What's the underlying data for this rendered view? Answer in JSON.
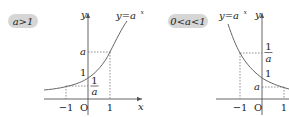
{
  "diagram": {
    "left": {
      "condition_label": "a>1",
      "function_label": "y=a^x",
      "function_label_base": "y=a",
      "function_label_exp": "x",
      "axis_x_label": "x",
      "axis_y_label": "y",
      "origin_label": "O",
      "x_ticks": [
        "−1",
        "1"
      ],
      "y_ticks": {
        "a": "a",
        "one": "1",
        "inv_num": "1",
        "inv_den": "a"
      },
      "behavior": "increasing"
    },
    "right": {
      "condition_label": "0<a<1",
      "function_label": "y=a^x",
      "function_label_base": "y=a",
      "function_label_exp": "x",
      "axis_y_label": "y",
      "origin_label": "O",
      "x_ticks": [
        "−1",
        "1"
      ],
      "y_ticks": {
        "a": "a",
        "one": "1",
        "inv_num": "1",
        "inv_den": "a"
      },
      "behavior": "decreasing"
    },
    "colors": {
      "badge": "#d6d6d6",
      "curve": "#666666",
      "axis": "#555555"
    }
  }
}
